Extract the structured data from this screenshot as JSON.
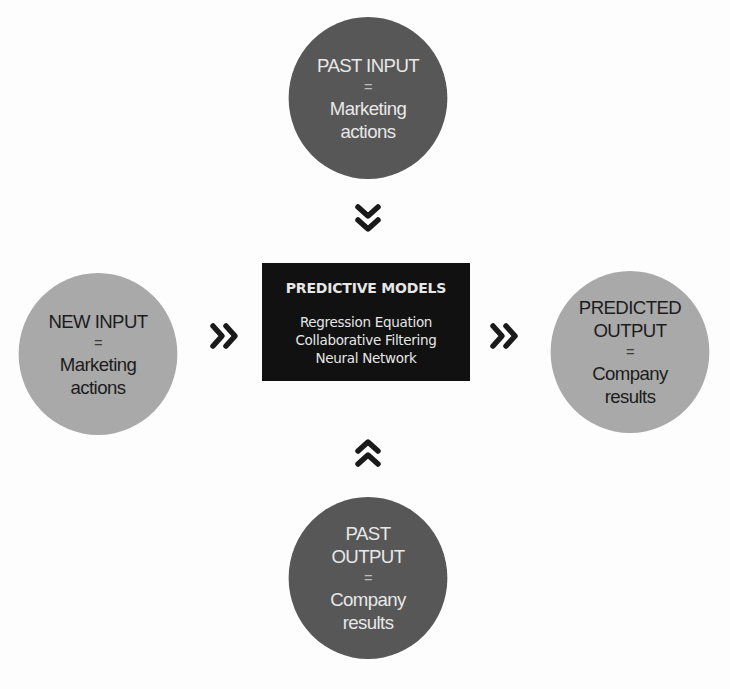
{
  "diagram": {
    "past_input": {
      "lines": [
        "PAST INPUT",
        "=",
        "Marketing",
        "actions"
      ]
    },
    "new_input": {
      "lines": [
        "NEW INPUT",
        "=",
        "Marketing",
        "actions"
      ]
    },
    "predicted_output": {
      "lines": [
        "PREDICTED",
        "OUTPUT",
        "=",
        "Company",
        "results"
      ]
    },
    "past_output": {
      "lines": [
        "PAST",
        "OUTPUT",
        "=",
        "Company",
        "results"
      ]
    },
    "predictive_models": {
      "title": "PREDICTIVE MODELS",
      "items": [
        "Regression Equation",
        "Collaborative Filtering",
        "Neural Network"
      ]
    },
    "arrows": {
      "top": "double-chevron-down-icon",
      "left": "double-chevron-right-icon",
      "right": "double-chevron-right-icon",
      "bottom": "double-chevron-up-icon"
    },
    "colors": {
      "dark_circle": "#575757",
      "light_circle": "#a9a9a9",
      "model_box": "#111111"
    }
  }
}
